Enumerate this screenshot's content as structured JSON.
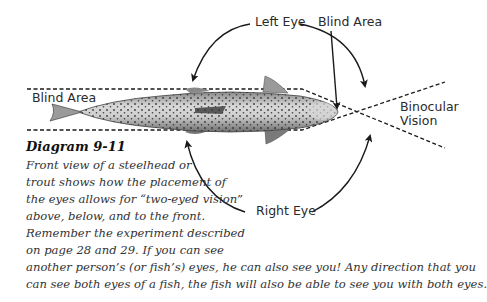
{
  "diagram": {
    "labels": {
      "left_eye": "Left Eye",
      "blind_area_top": "Blind Area",
      "blind_area_left": "Blind Area",
      "binocular_line1": "Binocular",
      "binocular_line2": "Vision",
      "right_eye": "Right Eye"
    }
  },
  "caption": {
    "title": "Diagram 9-11",
    "lines": [
      "Front view of a steelhead or",
      "trout shows how the placement of",
      "the eyes allows for “two-eyed vision”",
      "above, below, and to the front.",
      "Remember the experiment described",
      "on page 28 and 29. If you can see",
      "another person’s (or fish’s) eyes, he can also see you! Any direction that you",
      "can see both eyes of a fish, the fish will also be able to see you with both eyes."
    ]
  },
  "colors": {
    "line": "#1a1a1a",
    "fish_body": "#b8b8b8",
    "fish_spots": "#2b2b2b",
    "text": "#2a2a2a"
  }
}
